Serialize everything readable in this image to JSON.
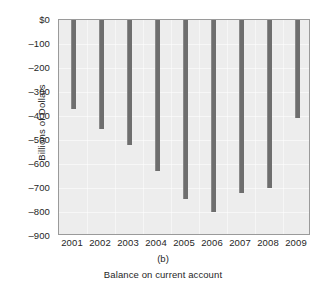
{
  "chart_data": {
    "type": "bar",
    "title": "",
    "subtitle": "",
    "panel_letter": "(b)",
    "caption": "Balance on current account",
    "xlabel": "",
    "ylabel": "Billions of Dollars",
    "categories": [
      "2001",
      "2002",
      "2003",
      "2004",
      "2005",
      "2006",
      "2007",
      "2008",
      "2009"
    ],
    "values": [
      -370,
      -455,
      -520,
      -630,
      -745,
      -800,
      -720,
      -700,
      -410
    ],
    "ylim": [
      -900,
      0
    ],
    "ytick_values": [
      0,
      -100,
      -200,
      -300,
      -400,
      -500,
      -600,
      -700,
      -800,
      -900
    ],
    "ytick_labels": [
      "$0",
      "–100",
      "–200",
      "–300",
      "–400",
      "–500",
      "–600",
      "–700",
      "–800",
      "–900"
    ],
    "grid": true,
    "legend": "none",
    "bar_color": "#6e6e6e",
    "plot_background": "#ededed",
    "frame_color": "#9a9a9a"
  }
}
